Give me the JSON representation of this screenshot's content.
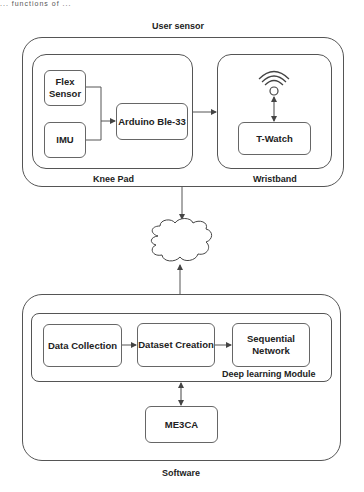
{
  "caption_fragment": "... functions of ...",
  "user_sensor": {
    "title": "User sensor",
    "knee_pad": {
      "label": "Knee Pad",
      "nodes": {
        "flex_sensor": "Flex Sensor",
        "imu": "IMU",
        "arduino": "Arduino Ble-33"
      }
    },
    "wristband": {
      "label": "Wristband",
      "icon": "wifi-icon",
      "nodes": {
        "t_watch": "T-Watch"
      }
    }
  },
  "cloud": {
    "label": "Cloud",
    "icon": "cloud-shape"
  },
  "software": {
    "title": "Software",
    "deep_learning_module": {
      "label": "Deep learning Module",
      "nodes": {
        "data_collection": "Data Collection",
        "dataset_creation": "Dataset Creation",
        "sequential_network": "Sequential Network"
      }
    },
    "nodes": {
      "me3ca": "ME3CA"
    }
  },
  "edges": [
    {
      "from": "Flex Sensor",
      "to": "Arduino Ble-33",
      "type": "arrow"
    },
    {
      "from": "IMU",
      "to": "Arduino Ble-33",
      "type": "arrow"
    },
    {
      "from": "Knee Pad",
      "to": "Wristband",
      "type": "arrow"
    },
    {
      "from": "WiFi",
      "to": "T-Watch",
      "type": "bidirectional"
    },
    {
      "from": "User sensor",
      "to": "Cloud",
      "type": "arrow"
    },
    {
      "from": "Software",
      "to": "Cloud",
      "type": "arrow"
    },
    {
      "from": "Data Collection",
      "to": "Dataset Creation",
      "type": "arrow"
    },
    {
      "from": "Dataset Creation",
      "to": "Sequential Network",
      "type": "arrow"
    },
    {
      "from": "Deep learning Module",
      "to": "ME3CA",
      "type": "bidirectional"
    }
  ],
  "colors": {
    "stroke": "#555555",
    "text": "#222222",
    "background": "#ffffff"
  }
}
